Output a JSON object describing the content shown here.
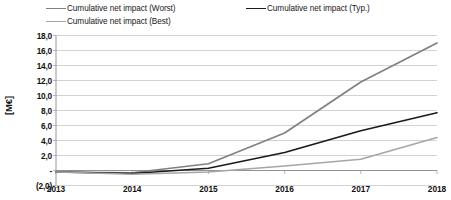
{
  "chart_data": {
    "type": "line",
    "title": "",
    "xlabel": "",
    "ylabel": "[M€]",
    "categories": [
      "2013",
      "2014",
      "2015",
      "2016",
      "2017",
      "2018"
    ],
    "x": [
      2013,
      2014,
      2015,
      2016,
      2017,
      2018
    ],
    "ylim": [
      -2.0,
      18.0
    ],
    "ytick_step": 2.0,
    "ytick_labels": [
      "18,0",
      "16,0",
      "14,0",
      "12,0",
      "10,0",
      "8,0",
      "6,0",
      "4,0",
      "2,0",
      "-",
      "(2,0)"
    ],
    "ytick_values": [
      18.0,
      16.0,
      14.0,
      12.0,
      10.0,
      8.0,
      6.0,
      4.0,
      2.0,
      0.0,
      -2.0
    ],
    "grid": true,
    "grid_axis": "y",
    "legend_position": "top",
    "decimal_separator": ",",
    "negative_format": "parentheses",
    "zero_label": "-",
    "series": [
      {
        "name": "Cumulative net impact (Worst)",
        "color": "#808080",
        "values": [
          -0.2,
          -0.3,
          0.9,
          5.0,
          11.8,
          17.0
        ]
      },
      {
        "name": "Cumulative net impact (Typ.)",
        "color": "#1a1a1a",
        "values": [
          -0.2,
          -0.4,
          0.3,
          2.4,
          5.3,
          7.7
        ]
      },
      {
        "name": "Cumulative net impact (Best)",
        "color": "#a6a6a6",
        "values": [
          -0.2,
          -0.5,
          -0.2,
          0.6,
          1.5,
          4.4
        ]
      }
    ]
  },
  "legend": {
    "entries": [
      {
        "label": "Cumulative net impact (Worst)",
        "color": "#808080"
      },
      {
        "label": "Cumulative net impact (Typ.)",
        "color": "#1a1a1a"
      },
      {
        "label": "Cumulative net impact (Best)",
        "color": "#a6a6a6"
      }
    ]
  },
  "axes": {
    "y_title": "[M€]"
  }
}
